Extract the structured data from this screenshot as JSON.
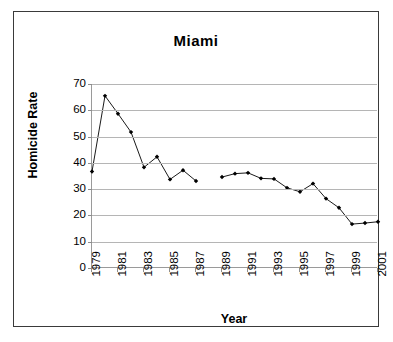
{
  "chart_data": {
    "type": "line",
    "title": "Miami",
    "xlabel": "Year",
    "ylabel": "Homicide Rate",
    "grid": true,
    "legend": "none",
    "xlim": [
      1979,
      2001
    ],
    "ylim": [
      0,
      70
    ],
    "ytick_step": 10,
    "xtick_step": 2,
    "y_ticks": [
      0,
      10,
      20,
      30,
      40,
      50,
      60,
      70
    ],
    "x_ticks": [
      1979,
      1981,
      1983,
      1985,
      1987,
      1989,
      1991,
      1993,
      1995,
      1997,
      1999,
      2001
    ],
    "x_tick_labels": [
      "1979",
      "1981",
      "1983",
      "1985",
      "1987",
      "1989",
      "1991",
      "1993",
      "1995",
      "1997",
      "1999",
      "2001"
    ],
    "y_tick_labels": [
      "0",
      "10",
      "20",
      "30",
      "40",
      "50",
      "60",
      "70"
    ],
    "marker": "filled-diamond",
    "line_color": "#000000",
    "marker_color": "#000000",
    "gap_years": [
      1988
    ],
    "x": [
      1979,
      1980,
      1981,
      1982,
      1983,
      1984,
      1985,
      1986,
      1987,
      1989,
      1990,
      1991,
      1992,
      1993,
      1994,
      1995,
      1996,
      1997,
      1998,
      1999,
      2000,
      2001
    ],
    "values": [
      36.7,
      65.5,
      58.7,
      51.7,
      38.3,
      42.3,
      33.7,
      37.2,
      33.1,
      34.6,
      35.9,
      36.2,
      34.1,
      33.9,
      30.5,
      29.0,
      32.1,
      26.4,
      22.9,
      16.7,
      17.1,
      17.6
    ],
    "series": [
      {
        "name": "Homicide Rate",
        "segments": [
          {
            "x": [
              1979,
              1980,
              1981,
              1982,
              1983,
              1984,
              1985,
              1986,
              1987
            ],
            "values": [
              36.7,
              65.5,
              58.7,
              51.7,
              38.3,
              42.3,
              33.7,
              37.2,
              33.1
            ]
          },
          {
            "x": [
              1989,
              1990,
              1991,
              1992,
              1993,
              1994,
              1995,
              1996,
              1997,
              1998,
              1999,
              2000,
              2001
            ],
            "values": [
              34.6,
              35.9,
              36.2,
              34.1,
              33.9,
              30.5,
              29.0,
              32.1,
              26.4,
              22.9,
              16.7,
              17.1,
              17.6
            ]
          }
        ]
      }
    ]
  },
  "colors": {
    "frame": "#3a3a3a",
    "axis": "#9a9a9a",
    "grid": "#b5b5b5",
    "data": "#000000",
    "background": "#ffffff"
  }
}
